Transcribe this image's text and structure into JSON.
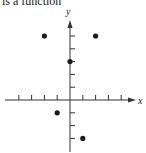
{
  "caption": "is a function",
  "chart_data": {
    "type": "scatter",
    "title": "",
    "xlabel": "x",
    "ylabel": "y",
    "xlim": [
      -4,
      4
    ],
    "ylim": [
      -4,
      6
    ],
    "grid": false,
    "points": [
      {
        "x": -2,
        "y": 5
      },
      {
        "x": 2,
        "y": 5
      },
      {
        "x": 0,
        "y": 3
      },
      {
        "x": -1,
        "y": -1
      },
      {
        "x": 1,
        "y": -3
      }
    ],
    "x_ticks": [
      -4,
      -3,
      -2,
      -1,
      1,
      2,
      3,
      4
    ],
    "y_ticks": [
      -3,
      -2,
      -1,
      1,
      2,
      3,
      4,
      5
    ]
  },
  "colors": {
    "ink": "#1a1a1a",
    "axis": "#333333"
  }
}
